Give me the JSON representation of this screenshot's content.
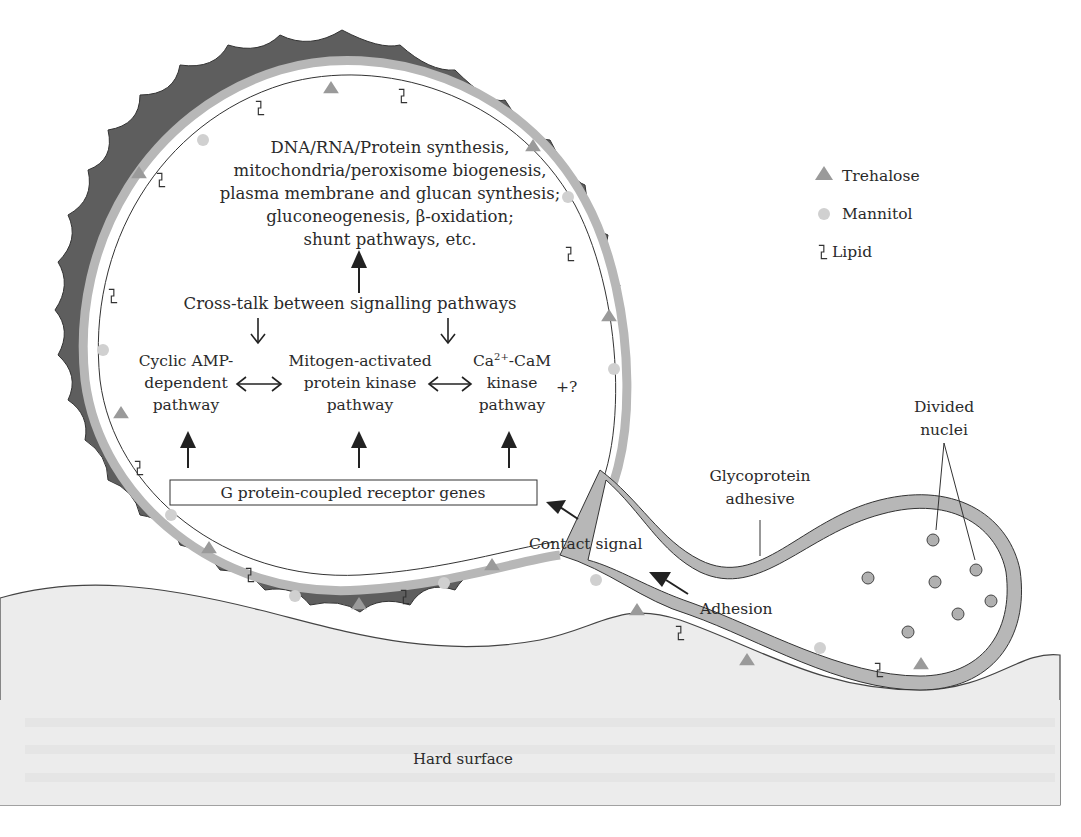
{
  "figure": {
    "top_clipped_text": "",
    "synthesis_block": {
      "lines": [
        "DNA/RNA/Protein synthesis,",
        "mitochondria/peroxisome biogenesis,",
        "plasma membrane and glucan synthesis;",
        "gluconeogenesis, β-oxidation;",
        "shunt pathways, etc."
      ]
    },
    "crosstalk_label": "Cross-talk between signalling pathways",
    "pathways": [
      {
        "lines": [
          "Cyclic AMP-",
          "dependent",
          "pathway"
        ]
      },
      {
        "lines": [
          "Mitogen-activated",
          "protein kinase",
          "pathway"
        ]
      },
      {
        "lines_html": [
          "Ca",
          "2+",
          "-CaM"
        ],
        "lines": [
          "Ca2+-CaM",
          "kinase",
          "pathway"
        ]
      }
    ],
    "unknown_pathway": "+?",
    "receptor_box": "G protein-coupled receptor genes",
    "contact_signal": "Contact signal",
    "adhesion": "Adhesion",
    "glycoprotein": [
      "Glycoprotein",
      "adhesive"
    ],
    "divided_nuclei": [
      "Divided",
      "nuclei"
    ],
    "hard_surface": "Hard surface",
    "legend": {
      "items": [
        {
          "icon": "triangle-icon",
          "label": "Trehalose",
          "color": "#9a9a9a"
        },
        {
          "icon": "circle-icon",
          "label": "Mannitol",
          "color": "#d0d0d0"
        },
        {
          "icon": "lipid-icon",
          "label": "Lipid",
          "color": "#333333"
        }
      ]
    },
    "colors": {
      "cell_wall": "#5e5e5e",
      "membrane": "#b7b7b7",
      "surface": "#ececec",
      "nucleus": "#b0b0b0",
      "trehalose": "#9a9a9a",
      "mannitol": "#d0d0d0"
    }
  }
}
